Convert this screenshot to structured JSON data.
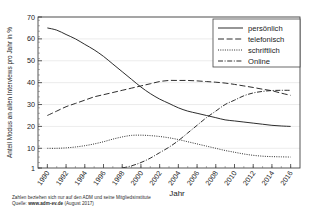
{
  "figure": {
    "ylabel": "Anteil Modus an allen Interviews pro Jahr in %",
    "xlabel": "Jahr",
    "footnote_line1": "Zahlen beziehen sich nur auf den ADM und seine Mitgliedsinstitute",
    "footnote_line2_prefix": "Quelle: ",
    "footnote_line2_strong": "www.adm-ev.de",
    "footnote_line2_suffix": " (August 2017)"
  },
  "chart_data": {
    "type": "line",
    "title": "",
    "xlabel": "Jahr",
    "ylabel": "Anteil Modus an allen Interviews pro Jahr in %",
    "xlim": [
      1989,
      2017
    ],
    "ylim": [
      1,
      70
    ],
    "grid": true,
    "legend_position": "top-right",
    "xticks": [
      1990,
      1992,
      1994,
      1996,
      1998,
      2000,
      2002,
      2004,
      2006,
      2008,
      2010,
      2012,
      2014,
      2016
    ],
    "xtick_labels": [
      "1990",
      "1992",
      "1994",
      "1996",
      "1998",
      "2000",
      "2002",
      "2004",
      "2006",
      "2008",
      "2010",
      "2012",
      "2014",
      "2016"
    ],
    "yticks": [
      1,
      10,
      20,
      30,
      40,
      50,
      60,
      70
    ],
    "ytick_labels": [
      "1",
      "10",
      "20",
      "30",
      "40",
      "50",
      "60",
      "70"
    ],
    "x": [
      1990,
      1991,
      1992,
      1993,
      1994,
      1995,
      1996,
      1997,
      1998,
      1999,
      2000,
      2001,
      2002,
      2003,
      2004,
      2005,
      2006,
      2007,
      2008,
      2009,
      2010,
      2011,
      2012,
      2013,
      2014,
      2015,
      2016
    ],
    "series": [
      {
        "name": "persönlich",
        "style": "solid",
        "color": "#222222",
        "values": [
          65,
          64,
          62,
          60,
          57.5,
          55,
          52,
          48.5,
          45,
          41.5,
          38,
          35,
          32.5,
          30.5,
          28.5,
          27,
          26,
          25,
          24,
          23,
          22.5,
          22,
          21.5,
          21,
          20.5,
          20.2,
          20
        ]
      },
      {
        "name": "telefonisch",
        "style": "dashed",
        "color": "#222222",
        "values": [
          25,
          27,
          29,
          30.5,
          32,
          33.5,
          34.5,
          35.5,
          36.5,
          37.5,
          38.5,
          39.5,
          40.5,
          41,
          41,
          41,
          40.8,
          40.5,
          40.2,
          39.8,
          39.2,
          38.5,
          37.8,
          37,
          36.3,
          35.2,
          34.2
        ]
      },
      {
        "name": "schriftlich",
        "style": "dotted",
        "color": "#222222",
        "values": [
          10,
          10,
          10.2,
          10.6,
          11.2,
          12,
          13,
          14.2,
          15.2,
          15.9,
          16,
          15.8,
          15.4,
          14.8,
          14,
          13,
          12,
          11,
          10,
          9,
          8.2,
          7.4,
          6.8,
          6.4,
          6.2,
          6.1,
          6
        ]
      },
      {
        "name": "Online",
        "style": "dashdot",
        "color": "#222222",
        "values": [
          null,
          null,
          null,
          null,
          null,
          null,
          null,
          null,
          1,
          2,
          3.5,
          5.5,
          8,
          10.5,
          13.5,
          17,
          20.5,
          24,
          27,
          30,
          32,
          34,
          35.3,
          36,
          36.4,
          36.5,
          36.5
        ]
      }
    ]
  }
}
